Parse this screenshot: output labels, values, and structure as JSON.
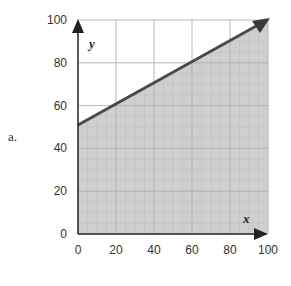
{
  "part_label": "a.",
  "chart_data": {
    "type": "line",
    "title": "",
    "xlabel": "x",
    "ylabel": "y",
    "xlim": [
      0,
      100
    ],
    "ylim": [
      0,
      100
    ],
    "x_ticks": [
      0,
      20,
      40,
      60,
      80,
      100
    ],
    "y_ticks": [
      0,
      20,
      40,
      60,
      80,
      100
    ],
    "grid": true,
    "series": [
      {
        "name": "boundary line",
        "x": [
          0,
          100
        ],
        "y": [
          50,
          100
        ]
      }
    ],
    "shaded_region": "below line (y <= 0.5x + 50)",
    "colors": {
      "line": "#4a4a4a",
      "shade": "#c9c9c9",
      "grid": "#bdbdbd"
    }
  }
}
